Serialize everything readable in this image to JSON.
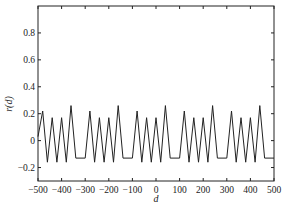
{
  "chart_data": {
    "type": "line",
    "title": "",
    "xlabel": "d",
    "ylabel": "r(d)",
    "xlim": [
      -500,
      500
    ],
    "ylim": [
      -0.3,
      1.0
    ],
    "grid": false,
    "legend": null,
    "xticks": [
      -500,
      -400,
      -300,
      -200,
      -100,
      0,
      100,
      200,
      300,
      400,
      500
    ],
    "xtick_labels": [
      "-500",
      "-400",
      "-300",
      "-200",
      "-100",
      "0",
      "100",
      "200",
      "300",
      "400",
      "500"
    ],
    "yticks": [
      -0.2,
      0,
      0.2,
      0.4,
      0.6,
      0.8
    ],
    "ytick_labels": [
      "-0.2",
      "0",
      "0.2",
      "0.4",
      "0.6",
      "0.8"
    ],
    "series": [
      {
        "name": "r(d)",
        "color": "#222222",
        "x": [
          -500,
          -480,
          -460,
          -440,
          -420,
          -400,
          -380,
          -360,
          -340,
          -300,
          -280,
          -260,
          -240,
          -220,
          -200,
          -180,
          -160,
          -140,
          -100,
          -80,
          -60,
          -40,
          -20,
          0,
          20,
          40,
          60,
          100,
          120,
          140,
          160,
          180,
          200,
          220,
          240,
          260,
          300,
          320,
          340,
          360,
          380,
          400,
          420,
          440,
          460,
          500
        ],
        "y": [
          0.03,
          0.22,
          -0.16,
          0.17,
          -0.16,
          0.17,
          -0.16,
          0.26,
          -0.13,
          -0.13,
          0.22,
          -0.16,
          0.17,
          -0.16,
          0.17,
          -0.16,
          0.26,
          -0.13,
          -0.13,
          0.22,
          -0.16,
          0.17,
          -0.16,
          0.17,
          -0.16,
          0.26,
          -0.13,
          -0.13,
          0.22,
          -0.16,
          0.17,
          -0.16,
          0.17,
          -0.16,
          0.26,
          -0.13,
          -0.13,
          0.22,
          -0.16,
          0.17,
          -0.16,
          0.17,
          -0.16,
          0.26,
          -0.13,
          -0.13
        ]
      }
    ]
  }
}
